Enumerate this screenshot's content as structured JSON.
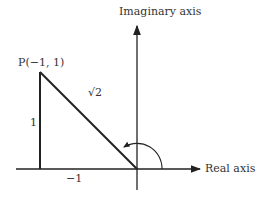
{
  "diagram": {
    "axes": {
      "imaginary_label": "Imaginary axis",
      "real_label": "Real axis"
    },
    "point_label": "P(−1, 1)",
    "hypotenuse_label": "√2",
    "vertical_side_label": "1",
    "horizontal_side_label": "−1",
    "colors": {
      "line": "#222222",
      "background": "#ffffff"
    }
  }
}
